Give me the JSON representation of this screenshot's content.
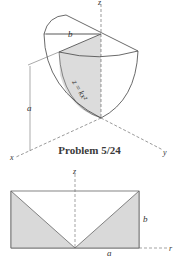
{
  "figure1": {
    "labels": {
      "z": "z",
      "b": "b",
      "a": "a",
      "x": "x",
      "y": "y",
      "curve": "z = kx²"
    }
  },
  "caption": "Problem 5/24",
  "figure2": {
    "labels": {
      "z": "z",
      "b": "b",
      "a": "a",
      "r": "r"
    }
  },
  "colors": {
    "shade": "#d9d9d9",
    "line": "#555555",
    "text": "#333333"
  }
}
